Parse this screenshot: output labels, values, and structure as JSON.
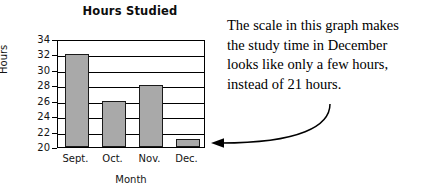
{
  "chart_data": {
    "type": "bar",
    "title": "Hours Studied",
    "xlabel": "Month",
    "ylabel": "Hours",
    "categories": [
      "Sept.",
      "Oct.",
      "Nov.",
      "Dec."
    ],
    "values": [
      32,
      26,
      28,
      21
    ],
    "ylim": [
      20,
      34
    ],
    "yticks": [
      20,
      22,
      24,
      26,
      28,
      30,
      32,
      34
    ],
    "grid": true,
    "legend": "none",
    "bar_color": "#a9a9a9",
    "bar_outline_color": "#1a1a1a",
    "axis_color": "#000000",
    "annotations": [
      {
        "text": "The scale in this graph makes the study time in December looks like only a few hours, instead of 21 hours.",
        "points_to": "Dec."
      }
    ]
  },
  "annotation": {
    "line1": "The scale in this graph makes",
    "line2": "the study time in December",
    "line3": "looks like only a few hours,",
    "line4": "instead of 21 hours."
  }
}
